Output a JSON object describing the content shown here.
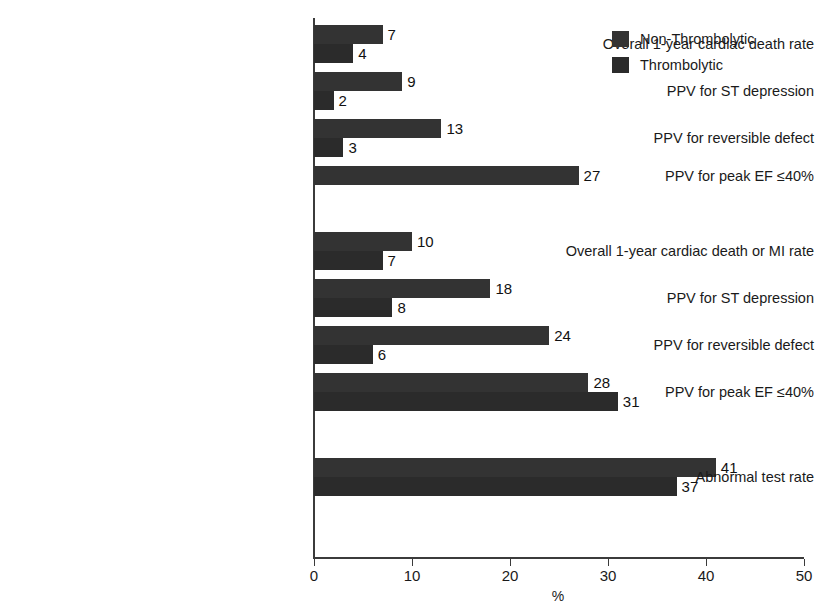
{
  "chart_data": {
    "type": "bar",
    "orientation": "horizontal",
    "title": "",
    "xlabel": "%",
    "ylabel": "",
    "xlim": [
      0,
      50
    ],
    "xticks": [
      0,
      10,
      20,
      30,
      40,
      50
    ],
    "xtick_labels": [
      "0",
      "10",
      "20",
      "30",
      "40",
      "50"
    ],
    "grid": false,
    "legend_position": "top-right",
    "series": [
      {
        "name": "Non-Thrombolytic",
        "color": "#333333",
        "values": [
          7,
          9,
          13,
          27,
          10,
          18,
          24,
          28,
          41
        ]
      },
      {
        "name": "Thrombolytic",
        "color": "#2b2b2b",
        "values": [
          4,
          2,
          3,
          null,
          7,
          8,
          6,
          31,
          37
        ]
      }
    ],
    "categories": [
      "Overall 1-year cardiac death rate",
      "PPV for ST depression",
      "PPV for reversible defect",
      "PPV for peak EF ≤40%",
      "Overall 1-year cardiac death or MI rate",
      "PPV for ST depression",
      "PPV for reversible defect",
      "PPV for peak EF ≤40%",
      "Abnormal test rate"
    ],
    "groups": [
      {
        "name": "group-1",
        "rows": [
          {
            "label": "Overall 1-year cardiac death rate",
            "non_thrombolytic": 7,
            "thrombolytic": 4
          },
          {
            "label": "PPV for ST depression",
            "non_thrombolytic": 9,
            "thrombolytic": 2
          },
          {
            "label": "PPV for reversible defect",
            "non_thrombolytic": 13,
            "thrombolytic": 3
          },
          {
            "label": "PPV for peak EF ≤40%",
            "non_thrombolytic": 27,
            "thrombolytic": null
          }
        ]
      },
      {
        "name": "group-2",
        "rows": [
          {
            "label": "Overall 1-year cardiac death or MI rate",
            "non_thrombolytic": 10,
            "thrombolytic": 7
          },
          {
            "label": "PPV for ST depression",
            "non_thrombolytic": 18,
            "thrombolytic": 8
          },
          {
            "label": "PPV for reversible defect",
            "non_thrombolytic": 24,
            "thrombolytic": 6
          },
          {
            "label": "PPV for peak EF ≤40%",
            "non_thrombolytic": 28,
            "thrombolytic": 31
          }
        ]
      },
      {
        "name": "group-3",
        "rows": [
          {
            "label": "Abnormal test rate",
            "non_thrombolytic": 41,
            "thrombolytic": 37
          }
        ]
      }
    ]
  },
  "legend": {
    "items": [
      {
        "label": "Non-Thrombolytic",
        "color": "#333333"
      },
      {
        "label": "Thrombolytic",
        "color": "#2b2b2b"
      }
    ]
  },
  "axis": {
    "x_title": "%",
    "tick_labels": [
      "0",
      "10",
      "20",
      "30",
      "40",
      "50"
    ]
  }
}
